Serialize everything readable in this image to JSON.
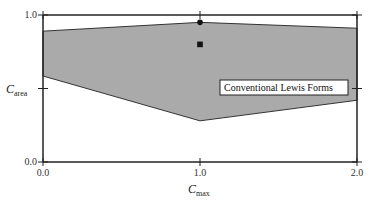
{
  "chart_data": {
    "type": "area",
    "title": "",
    "xlabel": "C_max",
    "xlabel_main": "C",
    "xlabel_sub": "max",
    "ylabel": "C_area",
    "ylabel_main": "C",
    "ylabel_sub": "area",
    "xlim": [
      0.0,
      2.0
    ],
    "ylim": [
      0.0,
      1.0
    ],
    "x_ticks": [
      {
        "value": 0.0,
        "label": "0.0"
      },
      {
        "value": 1.0,
        "label": "1.0"
      },
      {
        "value": 2.0,
        "label": "2.0"
      }
    ],
    "y_ticks": [
      {
        "value": 0.0,
        "label": "0.0"
      },
      {
        "value": 0.5,
        "label": ""
      },
      {
        "value": 1.0,
        "label": "1.0"
      }
    ],
    "grid": false,
    "region": {
      "name": "Conventional Lewis Forms",
      "fill": "#aaaaaa",
      "upper": {
        "x": [
          0.0,
          1.0,
          2.0
        ],
        "y": [
          0.89,
          0.95,
          0.91
        ]
      },
      "lower": {
        "x": [
          0.0,
          1.0,
          2.0
        ],
        "y": [
          0.585,
          0.28,
          0.42
        ]
      }
    },
    "points": [
      {
        "x": 1.0,
        "y": 0.95,
        "marker": "circle"
      },
      {
        "x": 1.0,
        "y": 0.8,
        "marker": "square"
      }
    ],
    "annotations": [
      {
        "text": "Conventional Lewis Forms",
        "x": 1.5,
        "y": 0.55,
        "boxed": true
      }
    ]
  }
}
